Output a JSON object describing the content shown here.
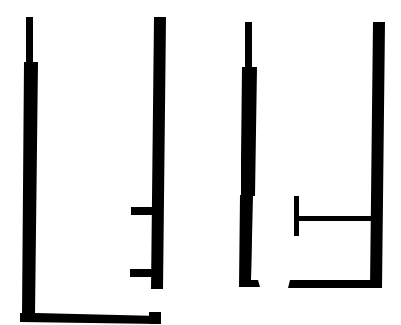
{
  "diagram": {
    "type": "floor-plan-outline",
    "colors": {
      "wall": "#000000",
      "background": "#ffffff"
    },
    "plans": [
      {
        "name": "left-room",
        "description": "Tall room outline with open top, two short stubs on the right wall and an L-shaped bottom wall"
      },
      {
        "name": "right-room",
        "description": "Tall room outline with open top, a gap in the bottom wall and a T-shaped interior partition"
      }
    ]
  }
}
